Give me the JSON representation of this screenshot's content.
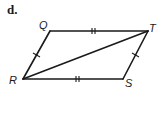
{
  "part_label": "d.",
  "vertices": {
    "Q": {
      "label": "Q",
      "x": 50,
      "y": 31
    },
    "T": {
      "label": "T",
      "x": 148,
      "y": 31
    },
    "R": {
      "label": "R",
      "x": 23,
      "y": 79
    },
    "S": {
      "label": "S",
      "x": 123,
      "y": 79
    }
  },
  "segments": [
    {
      "from": "Q",
      "to": "T",
      "ticks": 2
    },
    {
      "from": "R",
      "to": "S",
      "ticks": 2
    },
    {
      "from": "Q",
      "to": "R",
      "ticks": 1
    },
    {
      "from": "T",
      "to": "S",
      "ticks": 1
    },
    {
      "from": "R",
      "to": "T",
      "ticks": 0
    }
  ],
  "line_color": "#1a1a1a"
}
